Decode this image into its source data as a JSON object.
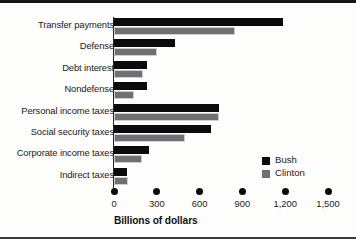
{
  "chart_data": {
    "type": "bar",
    "orientation": "horizontal",
    "title": "",
    "xlabel": "Billions of dollars",
    "ylabel": "",
    "xlim": [
      0,
      1500
    ],
    "xticks": [
      0,
      300,
      600,
      900,
      1200,
      1500
    ],
    "xtick_labels": [
      "0",
      "300",
      "600",
      "900",
      "1,200",
      "1,500"
    ],
    "grid": false,
    "legend_position": "right-middle",
    "categories": [
      "Transfer payments",
      "Defense",
      "Debt interest",
      "Nondefense",
      "Personal income taxes",
      "Social security taxes",
      "Corporate income taxes",
      "Indirect taxes"
    ],
    "series": [
      {
        "name": "Bush",
        "color": "#0b0b0d",
        "values": [
          1185,
          430,
          230,
          230,
          735,
          680,
          245,
          90
        ]
      },
      {
        "name": "Clinton",
        "color": "#6f7073",
        "values": [
          850,
          300,
          200,
          140,
          735,
          500,
          195,
          100
        ]
      }
    ]
  },
  "legend": {
    "items": [
      {
        "label": "Bush",
        "swatch": "bush-swatch"
      },
      {
        "label": "Clinton",
        "swatch": "clinton-swatch"
      }
    ]
  },
  "icons": {
    "tick_marker": "dot-marker-icon"
  }
}
